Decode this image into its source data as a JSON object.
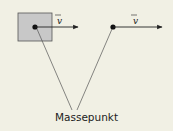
{
  "diagram": {
    "label": "Massepunkt",
    "vector_symbol": "v",
    "left_object": {
      "shape": "square",
      "fill": "#c8c8c8",
      "has_point": true
    },
    "right_object": {
      "shape": "point"
    },
    "colors": {
      "background": "#f1f0e4",
      "ink": "#222222",
      "box_fill": "#c8c8c8"
    }
  }
}
